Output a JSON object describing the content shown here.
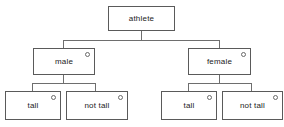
{
  "diagram": {
    "nodes": [
      {
        "id": "root",
        "label": "athlete",
        "has_marker": false
      },
      {
        "id": "male",
        "label": "male",
        "has_marker": true
      },
      {
        "id": "female",
        "label": "female",
        "has_marker": true
      },
      {
        "id": "male-tall",
        "label": "tall",
        "has_marker": true
      },
      {
        "id": "male-not-tall",
        "label": "not tall",
        "has_marker": true
      },
      {
        "id": "female-tall",
        "label": "tall",
        "has_marker": true
      },
      {
        "id": "female-not-tall",
        "label": "not tall",
        "has_marker": true
      }
    ],
    "marker_icon": "circle-icon",
    "colors": {
      "border": "#5a5a5a",
      "edge": "#6e6e6e",
      "text": "#222222",
      "background": "#ffffff"
    }
  }
}
